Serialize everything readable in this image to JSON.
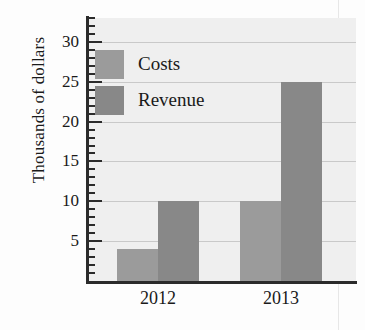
{
  "chart_data": {
    "type": "bar",
    "title": "",
    "xlabel": "",
    "ylabel": "Thousands of dollars",
    "categories": [
      "2012",
      "2013"
    ],
    "series": [
      {
        "name": "Costs",
        "values": [
          4,
          10
        ],
        "color": "#9b9b9b"
      },
      {
        "name": "Revenue",
        "values": [
          10,
          25
        ],
        "color": "#888888"
      }
    ],
    "ylim": [
      0,
      33
    ],
    "yticks": [
      5,
      10,
      15,
      20,
      25,
      30
    ],
    "ytick_labels": [
      "5",
      "10",
      "15",
      "20",
      "25",
      "30"
    ],
    "minor_tick_step": 1,
    "grid": true,
    "legend_position": "upper left",
    "plot_background": "#efefef",
    "grid_color": "#c9c9c9",
    "axis_color": "#2b2b2b"
  },
  "legend": {
    "items": [
      {
        "label": "Costs"
      },
      {
        "label": "Revenue"
      }
    ]
  }
}
